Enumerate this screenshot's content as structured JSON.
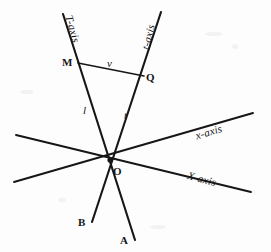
{
  "figure": {
    "background_color": "#fdfdfd",
    "stroke_color": "#161616",
    "width": 271,
    "height": 252
  },
  "labels": {
    "T_axis": "T-axis",
    "t_axis": "t-axis",
    "x_axis_lower": "x-axis",
    "X_axis_upper": "X-axis",
    "point_M": "M",
    "point_Q": "Q",
    "point_O": "O",
    "point_A": "A",
    "point_B": "B",
    "segment_v": "v",
    "segment_l": "l",
    "segment_t": "t"
  },
  "geometry": {
    "origin": {
      "x": 110,
      "y": 160
    },
    "lines": [
      {
        "name": "T-axis-line",
        "x1": 63,
        "y1": 14,
        "x2": 135,
        "y2": 240
      },
      {
        "name": "t-axis-line",
        "x1": 161,
        "y1": 12,
        "x2": 92,
        "y2": 222
      },
      {
        "name": "x-axis-line",
        "x1": 14,
        "y1": 182,
        "x2": 253,
        "y2": 113
      },
      {
        "name": "X-axis-line",
        "x1": 16,
        "y1": 135,
        "x2": 251,
        "y2": 192
      },
      {
        "name": "v-segment",
        "x1": 78,
        "y1": 63,
        "x2": 144,
        "y2": 76
      }
    ]
  }
}
